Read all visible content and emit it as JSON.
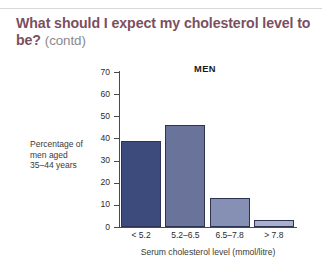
{
  "heading": {
    "main": "What should I expect my cholesterol level to be?",
    "contd": "(contd)"
  },
  "colors": {
    "heading": "#7b4f60",
    "contd": "#8a8a8a",
    "axis": "#4a4a4a",
    "bar_outline": "#2d3354",
    "bar_1": "#3d4a7c",
    "bar_2": "#6a7399",
    "bar_3": "#8690b5",
    "bar_4": "#a8b0cc",
    "rule": "#d7d7d7"
  },
  "chart_data": {
    "type": "bar",
    "title": "MEN",
    "categories": [
      "< 5.2",
      "5.2–6.5",
      "6.5–7.8",
      "> 7.8"
    ],
    "values": [
      39,
      46,
      13,
      3
    ],
    "series": [
      {
        "name": "Percentage of men aged 35–44 years",
        "values": [
          39,
          46,
          13,
          3
        ]
      }
    ],
    "xlabel": "Serum cholesterol level (mmol/litre)",
    "ylabel": "Percentage of men aged 35–44 years",
    "ylabel_lines": [
      "Percentage of",
      "men aged",
      "35–44 years"
    ],
    "ylim": [
      0,
      70
    ],
    "yticks": [
      0,
      10,
      20,
      30,
      40,
      50,
      60,
      70
    ],
    "ytick_labels": [
      "0",
      "10",
      "20",
      "30",
      "40",
      "50",
      "60",
      "70"
    ],
    "grid": false,
    "legend": "none",
    "bar_colors": [
      "#3d4a7c",
      "#6a7399",
      "#8690b5",
      "#a8b0cc"
    ]
  }
}
